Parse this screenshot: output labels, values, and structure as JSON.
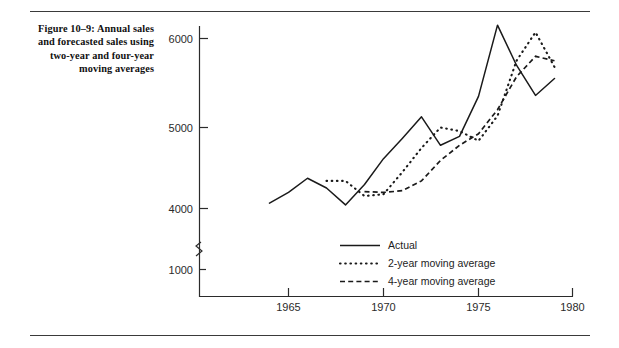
{
  "figure": {
    "caption": "Figure 10–9: Annual sales and forecasted sales using two-year and four-year moving averages"
  },
  "chart_data": {
    "type": "line",
    "title": "Figure 10–9: Annual sales and forecasted sales using two-year and four-year moving averages",
    "xlabel": "",
    "ylabel": "",
    "xlim": [
      1963,
      1980
    ],
    "ylim": [
      1000,
      6400
    ],
    "grid": false,
    "axis_break": {
      "between": [
        1000,
        4000
      ],
      "note": "y-axis broken below 4000"
    },
    "xticks": [
      1965,
      1970,
      1975,
      1980
    ],
    "xtick_labels": [
      "1965",
      "1970",
      "1975",
      "1980"
    ],
    "yticks": [
      1000,
      4000,
      5000,
      6000
    ],
    "ytick_labels": [
      "1000",
      "4000",
      "5000",
      "6000"
    ],
    "legend_position": "lower-center",
    "series": [
      {
        "name": "Actual",
        "style": "solid",
        "color": "#1a1a1a",
        "x": [
          1964,
          1965,
          1966,
          1967,
          1968,
          1969,
          1970,
          1971,
          1972,
          1973,
          1974,
          1975,
          1976,
          1977,
          1978,
          1979
        ],
        "values": [
          4150,
          4270,
          4430,
          4320,
          4130,
          4360,
          4650,
          4880,
          5120,
          4800,
          4900,
          5350,
          6150,
          5700,
          5360,
          5550
        ]
      },
      {
        "name": "2-year moving average",
        "style": "dotted",
        "color": "#1a1a1a",
        "x": [
          1967,
          1968,
          1969,
          1970,
          1971,
          1972,
          1973,
          1974,
          1975,
          1976,
          1977,
          1978,
          1979
        ],
        "values": [
          4400,
          4400,
          4230,
          4250,
          4500,
          4770,
          5000,
          4960,
          4850,
          5130,
          5750,
          6070,
          5680
        ]
      },
      {
        "name": "4-year moving average",
        "style": "dashed",
        "color": "#1a1a1a",
        "x": [
          1969,
          1970,
          1971,
          1972,
          1973,
          1974,
          1975,
          1976,
          1977,
          1978,
          1979
        ],
        "values": [
          4280,
          4270,
          4290,
          4400,
          4630,
          4800,
          4930,
          5200,
          5570,
          5800,
          5750
        ]
      }
    ]
  },
  "legend": {
    "items": [
      {
        "label": "Actual",
        "style": "solid"
      },
      {
        "label": "2-year moving average",
        "style": "dotted"
      },
      {
        "label": "4-year moving average",
        "style": "dashed"
      }
    ]
  },
  "axes": {
    "x_tick_labels": [
      "1965",
      "1970",
      "1975",
      "1980"
    ],
    "y_tick_labels": [
      "6000",
      "5000",
      "4000",
      "1000"
    ]
  }
}
